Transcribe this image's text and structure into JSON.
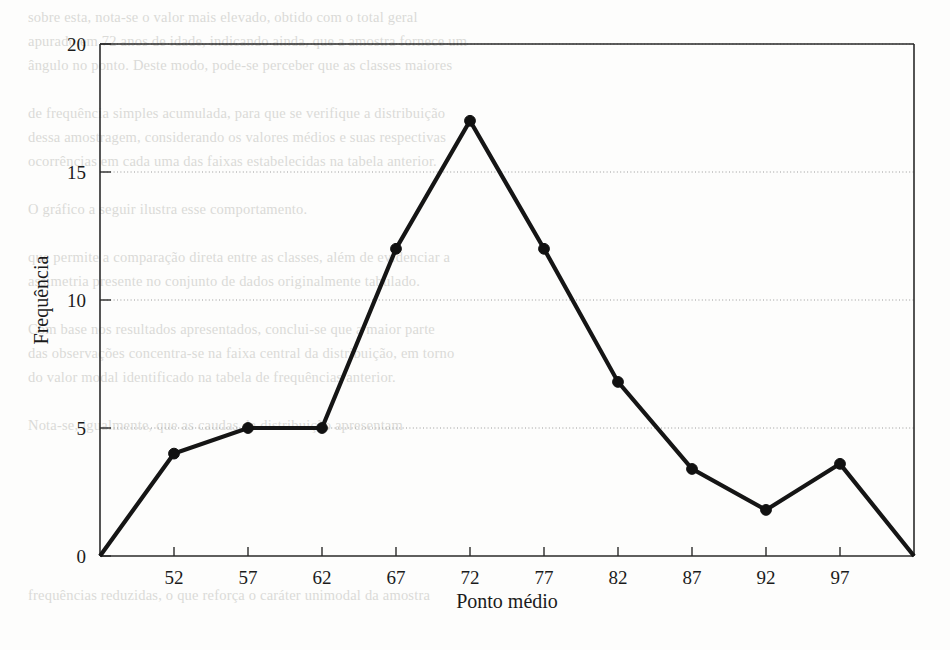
{
  "chart_data": {
    "type": "line",
    "title": "",
    "subtitle": "",
    "xlabel": "Ponto médio",
    "ylabel": "Frequência",
    "categories": [
      47,
      52,
      57,
      62,
      67,
      72,
      77,
      82,
      87,
      92,
      97,
      102
    ],
    "values": [
      0,
      4,
      5,
      5,
      12,
      17,
      12,
      6.8,
      3.4,
      1.8,
      3.6,
      0
    ],
    "x_tick_labels": [
      "52",
      "57",
      "62",
      "67",
      "72",
      "77",
      "82",
      "87",
      "92",
      "97"
    ],
    "x_tick_values": [
      52,
      57,
      62,
      67,
      72,
      77,
      82,
      87,
      92,
      97
    ],
    "y_tick_labels": [
      "0",
      "5",
      "10",
      "15",
      "20"
    ],
    "y_tick_values": [
      0,
      5,
      10,
      15,
      20
    ],
    "xlim": [
      47,
      102
    ],
    "ylim": [
      0,
      20
    ],
    "grid": true,
    "grid_axis": "y",
    "grid_style": "dotted",
    "legend": false,
    "legend_position": "none",
    "marker": "filled-circle",
    "markers_shown_at": [
      52,
      57,
      62,
      67,
      72,
      77,
      82,
      87,
      92,
      97
    ],
    "series": [
      {
        "name": "Frequência",
        "x": [
          47,
          52,
          57,
          62,
          67,
          72,
          77,
          82,
          87,
          92,
          97,
          102
        ],
        "values": [
          0,
          4,
          5,
          5,
          12,
          17,
          12,
          6.8,
          3.4,
          1.8,
          3.6,
          0
        ]
      }
    ]
  },
  "colors": {
    "line": "#151515",
    "marker": "#111111",
    "axis": "#2a2a2a",
    "grid": "#9a9a9a",
    "text": "#1b1b1b",
    "background": "#fdfdfc",
    "bleed": "#b9b9b4"
  },
  "background_bleed": {
    "description": "faint reverse-side scanned book text",
    "lines": [
      "sobre esta, nota-se o valor mais elevado, obtido com o total geral",
      "apurado em 72 anos de idade, indicando ainda, que a amostra fornece um",
      "ângulo no ponto. Deste modo, pode-se perceber que as classes maiores",
      "",
      "de frequência simples acumulada, para que se verifique a distribuição",
      "dessa amostragem, considerando os valores médios e suas respectivas",
      "ocorrências em cada uma das faixas estabelecidas na tabela anterior.",
      "",
      "     O gráfico a seguir ilustra esse comportamento.",
      "",
      "que permite a comparação direta entre as classes, além de evidenciar a",
      "assimetria presente no conjunto de dados originalmente tabulado.",
      "",
      "     Com base nos resultados apresentados, conclui-se que a maior parte",
      "das observações concentra-se na faixa central da distribuição, em torno",
      "do valor modal identificado na tabela de frequências anterior.",
      "",
      "     Nota-se, igualmente, que as caudas da distribuição apresentam",
      "frequências reduzidas, o que reforça o caráter unimodal da amostra"
    ]
  }
}
